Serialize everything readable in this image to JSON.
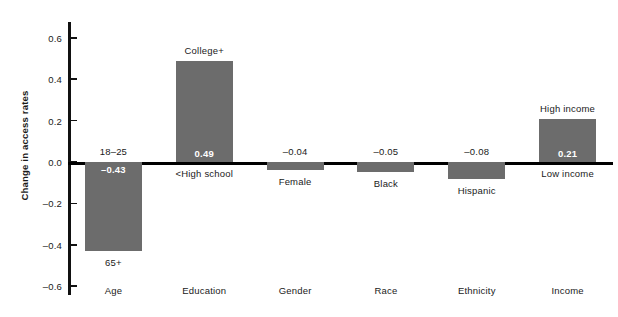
{
  "chart_data": {
    "type": "bar",
    "title": "",
    "xlabel": "",
    "ylabel": "Change in access rates",
    "ylim": [
      -0.6,
      0.6
    ],
    "grid": false,
    "legend": "none",
    "categories": [
      "Age",
      "Education",
      "Gender",
      "Race",
      "Ethnicity",
      "Income"
    ],
    "values": [
      -0.43,
      0.49,
      -0.04,
      -0.05,
      -0.08,
      0.21
    ],
    "value_labels": [
      "–0.43",
      "0.49",
      "–0.04",
      "–0.05",
      "–0.08",
      "0.21"
    ],
    "top_labels": [
      "18–25",
      "College+",
      "",
      "",
      "",
      "High income"
    ],
    "bottom_labels": [
      "65+",
      "<High school",
      "Female",
      "Black",
      "Hispanic",
      "Low income"
    ],
    "ytick_labels": [
      "0.6",
      "0.4",
      "0.2",
      "0.0",
      "–0.2",
      "–0.4",
      "–0.6"
    ],
    "ytick_values": [
      0.6,
      0.4,
      0.2,
      0.0,
      -0.2,
      -0.4,
      -0.6
    ],
    "bar_color": "#6c6c6c",
    "axis_color": "#000000",
    "value_label_inside": [
      true,
      true,
      false,
      false,
      false,
      true
    ]
  }
}
